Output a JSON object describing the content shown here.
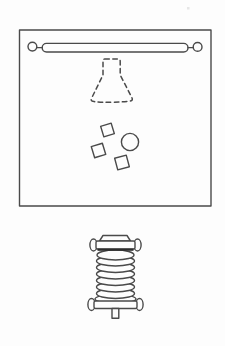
{
  "figure": {
    "kind": "technical-line-diagram",
    "text_content": "",
    "colors": {
      "paper": "#fdfdfd",
      "line": "#4a4a4a",
      "dark": "#2e2e2e"
    },
    "chamber": {
      "rod_end_circles": 2,
      "dashed_funnel_present": true,
      "fragments": {
        "squares": 3,
        "circles": 1
      }
    },
    "bellows_component": {
      "rib_count": 8,
      "side_knobs": 4,
      "has_top_cap": true,
      "has_bottom_stem": true
    }
  }
}
